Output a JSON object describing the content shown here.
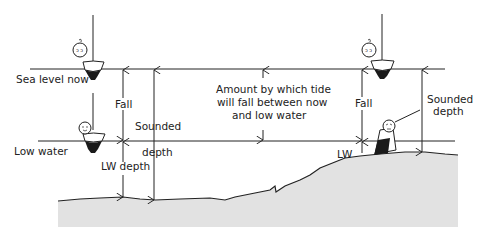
{
  "diagram": {
    "type": "tide-depth-diagram",
    "levels": {
      "sea_level_now": "Sea level now",
      "low_water": "Low water"
    },
    "left_group": {
      "fall": "Fall",
      "sounded": "Sounded",
      "depth": "depth",
      "lw_depth": "LW depth"
    },
    "center_note": {
      "line1": "Amount by which tide",
      "line2": "will fall between now",
      "line3": "and low water"
    },
    "right_group": {
      "fall": "Fall",
      "sounded": "Sounded",
      "depth": "depth",
      "lw": "LW"
    },
    "colors": {
      "line": "#222222",
      "seabed_fill": "#e2e2e2",
      "boat_hull": "#1a1a1a"
    }
  }
}
